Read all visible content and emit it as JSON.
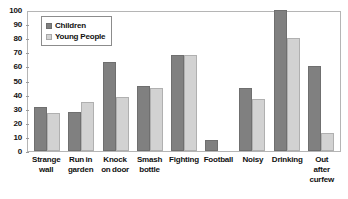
{
  "chart_data": {
    "type": "bar",
    "title": "",
    "subtitle": "",
    "xlabel": "",
    "ylabel": "",
    "ylim": [
      0,
      100
    ],
    "yticks": [
      0,
      10,
      20,
      30,
      40,
      50,
      60,
      70,
      80,
      90,
      100
    ],
    "ytick_labels": [
      "0",
      "10",
      "20",
      "30",
      "40",
      "50",
      "60",
      "70",
      "80",
      "90",
      "100"
    ],
    "grid": false,
    "legend_position": "top-left",
    "categories": [
      "Strange wall",
      "Run in garden",
      "Knock on door",
      "Smash bottle",
      "Fighting",
      "Football",
      "Noisy",
      "Drinking",
      "Out after curfew"
    ],
    "category_lines": [
      [
        "Strange",
        "wall"
      ],
      [
        "Run in",
        "garden"
      ],
      [
        "Knock",
        "on door"
      ],
      [
        "Smash",
        "bottle"
      ],
      [
        "Fighting"
      ],
      [
        "Football"
      ],
      [
        "Noisy"
      ],
      [
        "Drinking"
      ],
      [
        "Out",
        "after",
        "curfew"
      ]
    ],
    "series": [
      {
        "name": "Children",
        "color": "#808080",
        "values": [
          31,
          28,
          63,
          46,
          68,
          8,
          45,
          100,
          60
        ]
      },
      {
        "name": "Young People",
        "color": "#d2d2d2",
        "values": [
          27,
          35,
          38,
          45,
          68,
          0,
          37,
          80,
          13
        ]
      }
    ]
  },
  "legend": {
    "items": [
      {
        "label": "Children",
        "swatch": "children"
      },
      {
        "label": "Young People",
        "swatch": "young"
      }
    ]
  },
  "colors": {
    "children": "#808080",
    "young_people": "#d2d2d2",
    "axis": "#9a9a9a",
    "plot_border": "#b5b5b5",
    "text": "#111111",
    "background": "#ffffff"
  }
}
